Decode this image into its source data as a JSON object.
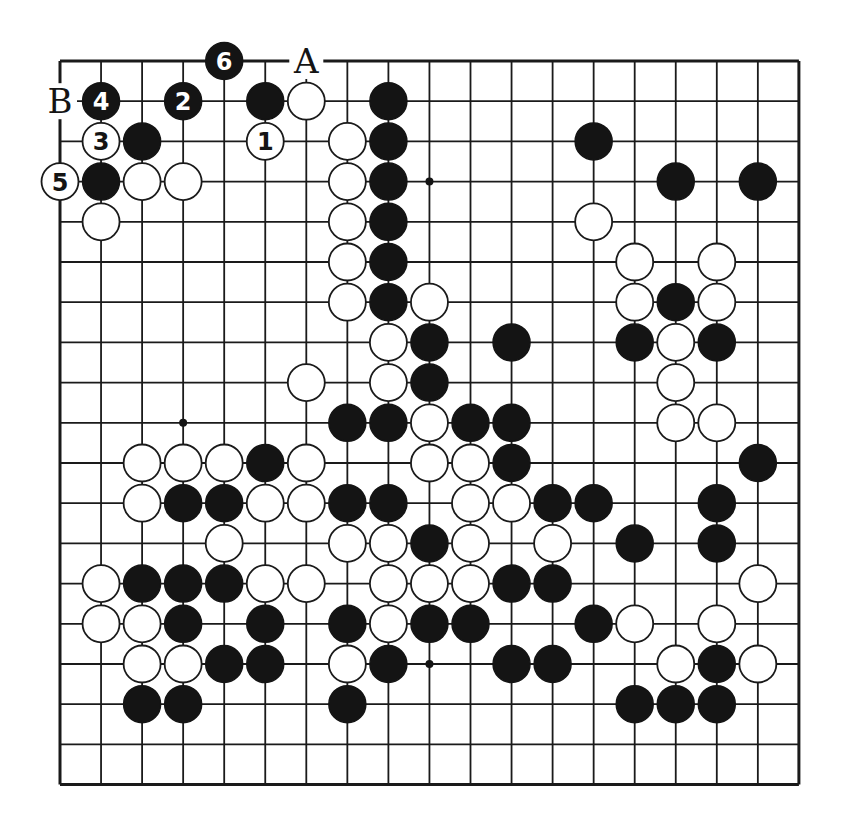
{
  "diagram": {
    "type": "go-board",
    "size": 19,
    "coordinate_system": "col,row zero-indexed from top-left",
    "colors": {
      "black_stone": "#141414",
      "white_stone": "#ffffff",
      "line": "#1a1a1a",
      "background": "#ffffff"
    },
    "star_points": [
      [
        9,
        3
      ],
      [
        3,
        9
      ],
      [
        9,
        15
      ]
    ],
    "labels": [
      {
        "text": "A",
        "col": 6,
        "row": 0
      },
      {
        "text": "B",
        "col": 0,
        "row": 1
      }
    ],
    "numbered_moves": [
      {
        "n": "1",
        "color": "white",
        "col": 5,
        "row": 2
      },
      {
        "n": "2",
        "color": "black",
        "col": 3,
        "row": 1
      },
      {
        "n": "3",
        "color": "white",
        "col": 1,
        "row": 2
      },
      {
        "n": "4",
        "color": "black",
        "col": 1,
        "row": 1
      },
      {
        "n": "5",
        "color": "white",
        "col": 0,
        "row": 3
      },
      {
        "n": "6",
        "color": "black",
        "col": 4,
        "row": 0
      }
    ],
    "black_stones": [
      [
        5,
        1
      ],
      [
        8,
        1
      ],
      [
        2,
        2
      ],
      [
        8,
        2
      ],
      [
        13,
        2
      ],
      [
        1,
        3
      ],
      [
        8,
        3
      ],
      [
        15,
        3
      ],
      [
        17,
        3
      ],
      [
        8,
        4
      ],
      [
        8,
        5
      ],
      [
        8,
        6
      ],
      [
        15,
        6
      ],
      [
        9,
        7
      ],
      [
        11,
        7
      ],
      [
        14,
        7
      ],
      [
        16,
        7
      ],
      [
        9,
        8
      ],
      [
        7,
        9
      ],
      [
        8,
        9
      ],
      [
        10,
        9
      ],
      [
        11,
        9
      ],
      [
        5,
        10
      ],
      [
        11,
        10
      ],
      [
        17,
        10
      ],
      [
        3,
        11
      ],
      [
        4,
        11
      ],
      [
        7,
        11
      ],
      [
        8,
        11
      ],
      [
        12,
        11
      ],
      [
        13,
        11
      ],
      [
        16,
        11
      ],
      [
        9,
        12
      ],
      [
        14,
        12
      ],
      [
        16,
        12
      ],
      [
        2,
        13
      ],
      [
        3,
        13
      ],
      [
        4,
        13
      ],
      [
        11,
        13
      ],
      [
        12,
        13
      ],
      [
        3,
        14
      ],
      [
        5,
        14
      ],
      [
        7,
        14
      ],
      [
        9,
        14
      ],
      [
        10,
        14
      ],
      [
        13,
        14
      ],
      [
        4,
        15
      ],
      [
        5,
        15
      ],
      [
        8,
        15
      ],
      [
        11,
        15
      ],
      [
        12,
        15
      ],
      [
        16,
        15
      ],
      [
        2,
        16
      ],
      [
        3,
        16
      ],
      [
        7,
        16
      ],
      [
        14,
        16
      ],
      [
        15,
        16
      ],
      [
        16,
        16
      ]
    ],
    "white_stones": [
      [
        6,
        1
      ],
      [
        7,
        2
      ],
      [
        2,
        3
      ],
      [
        3,
        3
      ],
      [
        7,
        3
      ],
      [
        1,
        4
      ],
      [
        7,
        4
      ],
      [
        13,
        4
      ],
      [
        7,
        5
      ],
      [
        14,
        5
      ],
      [
        16,
        5
      ],
      [
        7,
        6
      ],
      [
        9,
        6
      ],
      [
        14,
        6
      ],
      [
        16,
        6
      ],
      [
        8,
        7
      ],
      [
        15,
        7
      ],
      [
        6,
        8
      ],
      [
        8,
        8
      ],
      [
        15,
        8
      ],
      [
        9,
        9
      ],
      [
        15,
        9
      ],
      [
        16,
        9
      ],
      [
        2,
        10
      ],
      [
        3,
        10
      ],
      [
        4,
        10
      ],
      [
        6,
        10
      ],
      [
        9,
        10
      ],
      [
        10,
        10
      ],
      [
        2,
        11
      ],
      [
        5,
        11
      ],
      [
        6,
        11
      ],
      [
        10,
        11
      ],
      [
        11,
        11
      ],
      [
        4,
        12
      ],
      [
        7,
        12
      ],
      [
        8,
        12
      ],
      [
        10,
        12
      ],
      [
        12,
        12
      ],
      [
        1,
        13
      ],
      [
        5,
        13
      ],
      [
        6,
        13
      ],
      [
        8,
        13
      ],
      [
        9,
        13
      ],
      [
        10,
        13
      ],
      [
        17,
        13
      ],
      [
        1,
        14
      ],
      [
        2,
        14
      ],
      [
        8,
        14
      ],
      [
        14,
        14
      ],
      [
        16,
        14
      ],
      [
        2,
        15
      ],
      [
        3,
        15
      ],
      [
        7,
        15
      ],
      [
        15,
        15
      ],
      [
        17,
        15
      ]
    ]
  },
  "layout": {
    "origin_x": 60,
    "origin_y": 61,
    "step_x": 41.05,
    "step_y": 40.2,
    "stone_radius": 18.5
  }
}
